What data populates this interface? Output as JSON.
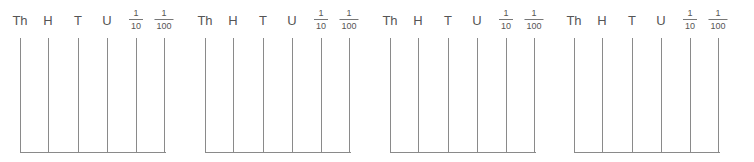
{
  "abaci": [
    {
      "offset": 0
    },
    {
      "offset": 185
    },
    {
      "offset": 370
    },
    {
      "offset": 554
    }
  ],
  "columns": [
    {
      "type": "text",
      "label": "Th",
      "x": 20
    },
    {
      "type": "text",
      "label": "H",
      "x": 48
    },
    {
      "type": "text",
      "label": "T",
      "x": 78
    },
    {
      "type": "text",
      "label": "U",
      "x": 107
    },
    {
      "type": "frac",
      "num": "1",
      "den": "10",
      "x": 136
    },
    {
      "type": "frac",
      "num": "1",
      "den": "100",
      "x": 164
    }
  ],
  "style": {
    "line_color": "#8a8a8a",
    "text_color": "#555555"
  }
}
